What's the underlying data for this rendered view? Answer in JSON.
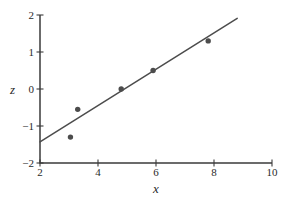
{
  "chart_data": {
    "type": "scatter",
    "title": "",
    "xlabel": "x",
    "ylabel": "z",
    "xlim": [
      2,
      10
    ],
    "ylim": [
      -2,
      2
    ],
    "grid": false,
    "legend": false,
    "xticks": {
      "values": [
        2,
        4,
        6,
        8,
        10
      ],
      "labels": [
        "2",
        "4",
        "6",
        "8",
        "10"
      ]
    },
    "yticks": {
      "values": [
        -2,
        -1,
        0,
        1,
        2
      ],
      "labels": [
        "−2",
        "−1",
        "0",
        "1",
        "2"
      ]
    },
    "scatter": {
      "name": "observations",
      "points": [
        [
          3.05,
          -1.3
        ],
        [
          3.3,
          -0.55
        ],
        [
          4.8,
          0.0
        ],
        [
          5.9,
          0.5
        ],
        [
          7.8,
          1.3
        ]
      ],
      "color": "#4c4c4c",
      "radius": 2.7
    },
    "line": {
      "name": "fit-line",
      "x": [
        2.0,
        8.8
      ],
      "y": [
        -1.43,
        1.91
      ],
      "color": "#4c4c4c",
      "width": 1.5
    },
    "axis_color": "#3b3b3b",
    "text_color": "#2a2a2a",
    "background": "#ffffff"
  }
}
